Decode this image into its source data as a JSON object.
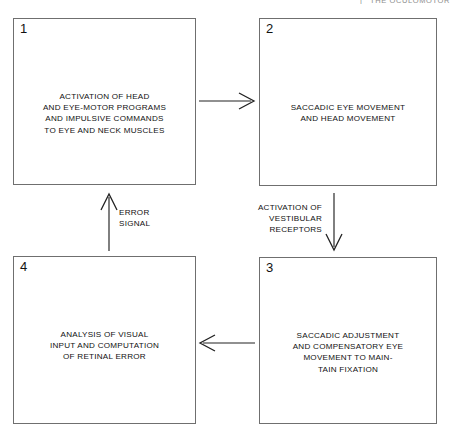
{
  "header": {
    "left_fragment": "",
    "separator": "|",
    "right_fragment": "THE OCULOMOTOR"
  },
  "diagram": {
    "type": "flowchart",
    "background_color": "#ffffff",
    "line_color": "#6f6f6f",
    "text_color": "#111111",
    "boxes": [
      {
        "number": "1",
        "text": "ACTIVATION OF HEAD\nAND EYE-MOTOR PROGRAMS\nAND IMPULSIVE COMMANDS\nTO EYE AND NECK MUSCLES"
      },
      {
        "number": "2",
        "text": "SACCADIC EYE MOVEMENT\nAND HEAD MOVEMENT"
      },
      {
        "number": "3",
        "text": "SACCADIC ADJUSTMENT\nAND COMPENSATORY EYE\nMOVEMENT TO MAIN-\nTAIN FIXATION"
      },
      {
        "number": "4",
        "text": "ANALYSIS OF VISUAL\nINPUT AND COMPUTATION\nOF RETINAL ERROR"
      }
    ],
    "edges": [
      {
        "from": "1",
        "to": "2",
        "direction": "right",
        "label": ""
      },
      {
        "from": "2",
        "to": "3",
        "direction": "down",
        "label": "ACTIVATION OF\nVESTIBULAR\nRECEPTORS"
      },
      {
        "from": "3",
        "to": "4",
        "direction": "left",
        "label": ""
      },
      {
        "from": "4",
        "to": "1",
        "direction": "up",
        "label": "ERROR\nSIGNAL"
      }
    ]
  }
}
